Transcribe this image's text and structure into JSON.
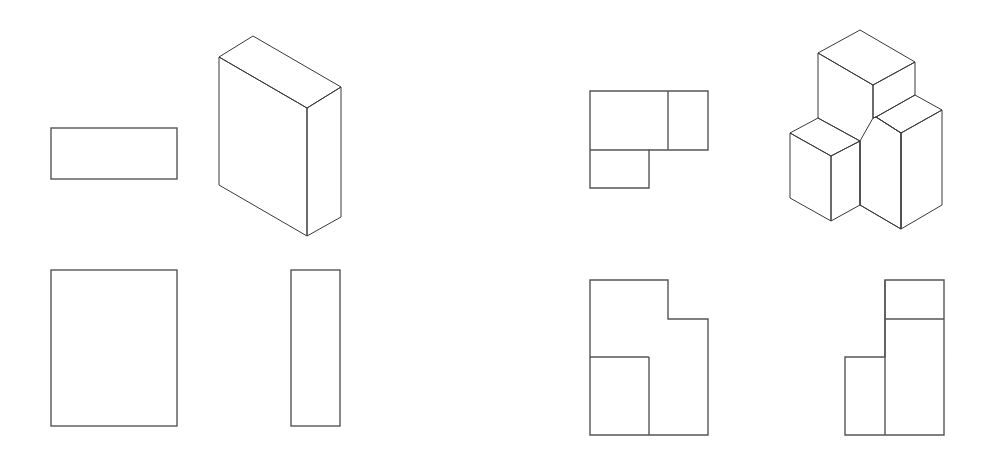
{
  "figure": {
    "colors": {
      "line": "#555555",
      "face_dark": "#6e6e6e",
      "face_mid": "#8a8a8a",
      "face_light": "#d8d8d8",
      "background": "#ffffff"
    }
  },
  "object_1": {
    "name": "rectangular-block",
    "top_view": {
      "x": 51,
      "y": 128,
      "w": 126,
      "h": 51
    },
    "front_view": {
      "x": 51,
      "y": 270,
      "w": 126,
      "h": 156
    },
    "side_view": {
      "x": 291,
      "y": 270,
      "w": 49,
      "h": 156
    },
    "isometric": {
      "top_face": "219,57 253,36 341,87 307,108",
      "left_face": "219,57 307,108 307,236 219,185",
      "right_face": "307,108 341,87 341,217 307,236"
    }
  },
  "object_2": {
    "name": "stepped-composite-block",
    "top_view": {
      "outline": "590,91 708,91 708,150 649,150 649,188 590,188",
      "lines": [
        {
          "x1": 668,
          "y1": 91,
          "x2": 668,
          "y2": 150
        },
        {
          "x1": 590,
          "y1": 150,
          "x2": 649,
          "y2": 150
        }
      ]
    },
    "front_view": {
      "outline": "590,280 668,280 668,319 708,319 708,435 590,435",
      "lines": [
        {
          "x1": 590,
          "y1": 357,
          "x2": 649,
          "y2": 357
        },
        {
          "x1": 649,
          "y1": 357,
          "x2": 649,
          "y2": 435
        }
      ]
    },
    "side_view": {
      "outline": "885,280 944,280 944,435 845,435 845,357 885,357",
      "lines": [
        {
          "x1": 885,
          "y1": 280,
          "x2": 885,
          "y2": 435
        },
        {
          "x1": 885,
          "y1": 319,
          "x2": 944,
          "y2": 319
        }
      ]
    },
    "isometric": {
      "tall_top": "818,53 860,30 915,62 873,85",
      "tall_left": "818,53 873,85 873,118 860,126 860,141 818,118",
      "tall_right": "873,85 915,62 915,95 876,117 873,118",
      "step_top": "876,117 915,95 942,110 901,133",
      "step_right": "901,133 942,110 942,205 901,229",
      "middle_front": "860,141 873,118 876,117 901,133 901,229 860,205",
      "small_top": "790,133 818,118 860,141 831,156",
      "small_left": "790,133 831,156 831,221 790,198",
      "small_right": "831,156 860,141 860,205 831,221"
    }
  }
}
